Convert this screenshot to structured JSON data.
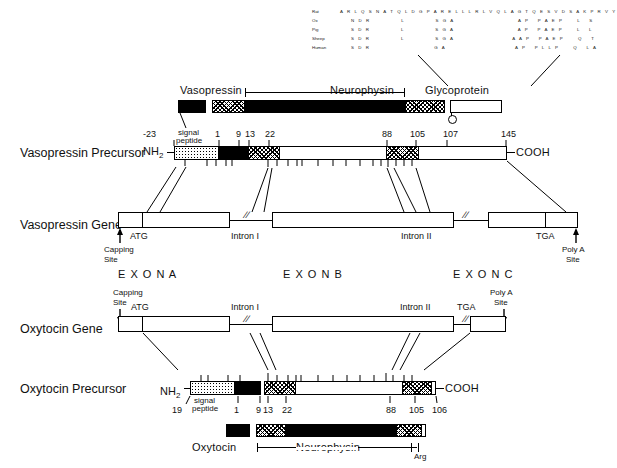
{
  "figure": {
    "alignment": {
      "rows": [
        {
          "species": "Rat",
          "seq": "A R L Q S N A T Q L D G P A R E L L L R L V Q L A G T Q E S V D S A K P R V Y"
        },
        {
          "species": "Ox",
          "seq": "    N D R           L           S G A                       A P   P A E P     L   S"
        },
        {
          "species": "Pig",
          "seq": "    S D R           L           S G A                       A P   P A E P     L   L"
        },
        {
          "species": "Sheep",
          "seq": "    S D R           L           S G A                     A A P   P A E P     Q   T"
        },
        {
          "species": "Human",
          "seq": "    S D R                       G A                         A P   P L L P     Q   L A"
        }
      ]
    },
    "top_bar": {
      "labels": {
        "vasopressin": "Vasopressin",
        "neurophysin": "Neurophysin",
        "glycoprotein": "Glycoprotein"
      }
    },
    "vasopressin_precursor": {
      "row_label": "Vasopressin Precursor",
      "n_term": "NH2",
      "c_term": "COOH",
      "signal_peptide_label": "signal\npeptide",
      "signal_line1": "signal",
      "signal_line2": "peptide",
      "markers": [
        "-23",
        "1",
        "9",
        "13",
        "22",
        "88",
        "105",
        "107",
        "145"
      ]
    },
    "vasopressin_gene": {
      "row_label": "Vasopressin Gene",
      "atg": "ATG",
      "tga": "TGA",
      "intron1": "Intron I",
      "intron2": "Intron II",
      "capping_site_l1": "Capping",
      "capping_site_l2": "Site",
      "polya_l1": "Poly A",
      "polya_l2": "Site",
      "exons": [
        "E X O N    A",
        "E X O N    B",
        "E X O N    C"
      ]
    },
    "oxytocin_gene": {
      "row_label": "Oxytocin Gene",
      "atg": "ATG",
      "tga": "TGA",
      "intron1": "Intron I",
      "intron2": "Intron II",
      "capping_site_l1": "Capping",
      "capping_site_l2": "Site",
      "polya_l1": "Poly A",
      "polya_l2": "Site"
    },
    "oxytocin_precursor": {
      "row_label": "Oxytocin Precursor",
      "n_term": "NH2",
      "c_term": "COOH",
      "signal_line1": "signal",
      "signal_line2": "peptide",
      "markers": [
        "19",
        "1",
        "9",
        "13",
        "22",
        "88",
        "105",
        "106"
      ]
    },
    "bottom_bar": {
      "oxytocin": "Oxytocin",
      "neurophysin": "Neurophysin",
      "arg": "Arg"
    }
  }
}
